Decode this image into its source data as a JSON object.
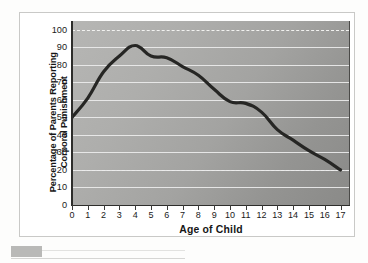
{
  "figure": {
    "y_axis_title": "Percentage of Parents Reporting\nCorporal Punishment",
    "x_axis_title": "Age of Child"
  },
  "chart_data": {
    "type": "line",
    "title": "",
    "subtitle": "",
    "xlabel": "Age of Child",
    "ylabel": "Percentage of Parents Reporting Corporal Punishment",
    "xlim": [
      0,
      17.6
    ],
    "ylim": [
      0,
      105
    ],
    "x_ticks": [
      0,
      1,
      2,
      3,
      4,
      5,
      6,
      7,
      8,
      9,
      10,
      11,
      12,
      13,
      14,
      15,
      16,
      17
    ],
    "y_ticks": [
      0,
      10,
      20,
      30,
      40,
      50,
      60,
      70,
      80,
      90,
      100
    ],
    "grid": "horizontal",
    "gridlines_solid": [
      10,
      20,
      30,
      40,
      50,
      60,
      70,
      80,
      90
    ],
    "gridlines_dashed": [
      20,
      100
    ],
    "legend": "none",
    "line_color": "#262624",
    "line_width": 3.2,
    "plot_background": "grey-gradient",
    "x": [
      0,
      1,
      2,
      3,
      4,
      5,
      6,
      7,
      8,
      9,
      10,
      11,
      12,
      13,
      14,
      15,
      16,
      17
    ],
    "values": [
      50,
      61,
      76,
      85,
      91,
      85,
      84,
      79,
      74,
      66,
      59,
      58,
      53,
      43,
      37,
      31,
      26,
      20
    ],
    "series": [
      {
        "name": "Parents reporting corporal punishment",
        "values": [
          50,
          61,
          76,
          85,
          91,
          85,
          84,
          79,
          74,
          66,
          59,
          58,
          53,
          43,
          37,
          31,
          26,
          20
        ]
      }
    ],
    "annotations": []
  }
}
